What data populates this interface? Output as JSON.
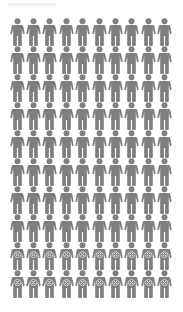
{
  "chart_data": {
    "type": "pictogram",
    "title": "",
    "rows": 10,
    "columns": 10,
    "total": 100,
    "categories": [
      "unaffected",
      "affected"
    ],
    "values": [
      80,
      20
    ],
    "series": [
      {
        "name": "unaffected",
        "icon": "person-icon",
        "count": 80,
        "color": "#7f7f7f"
      },
      {
        "name": "affected",
        "icon": "person-x-icon",
        "count": 20,
        "color": "#7f7f7f",
        "mark_color": "#e0e0e0"
      }
    ],
    "fill_order": "row-major, affected icons in last 2 rows"
  },
  "colors": {
    "icon": "#7f7f7f",
    "mark": "#dcdcdc",
    "background": "#ffffff"
  }
}
